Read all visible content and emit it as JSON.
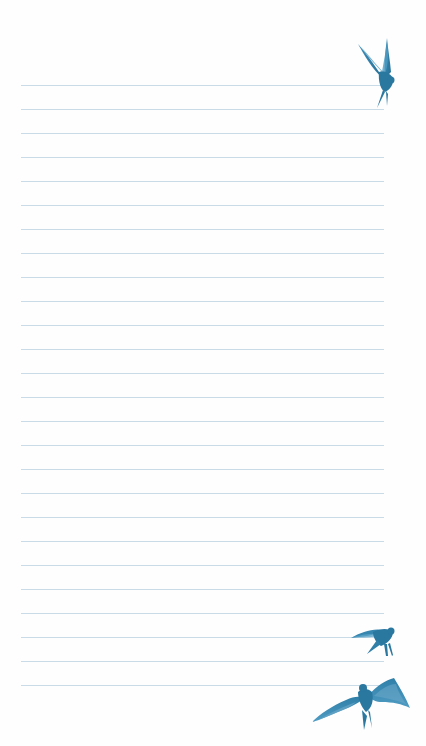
{
  "page": {
    "type": "ruled-notepaper",
    "background_color": "#fefefe",
    "line_color": "#c9dbe6",
    "line_count": 26,
    "first_line_y": 85,
    "line_spacing": 24,
    "line_left": 21,
    "line_width": 363
  },
  "decorations": {
    "accent_color": "#2f7fa8",
    "accent_light": "#6aa7c8",
    "birds": [
      {
        "name": "swallow-perched-top-right",
        "x": 357,
        "y": 38,
        "w": 38,
        "h": 70
      },
      {
        "name": "swallow-flying-small",
        "x": 351,
        "y": 626,
        "w": 45,
        "h": 32
      },
      {
        "name": "swallow-flying-large",
        "x": 312,
        "y": 678,
        "w": 100,
        "h": 52
      }
    ]
  }
}
